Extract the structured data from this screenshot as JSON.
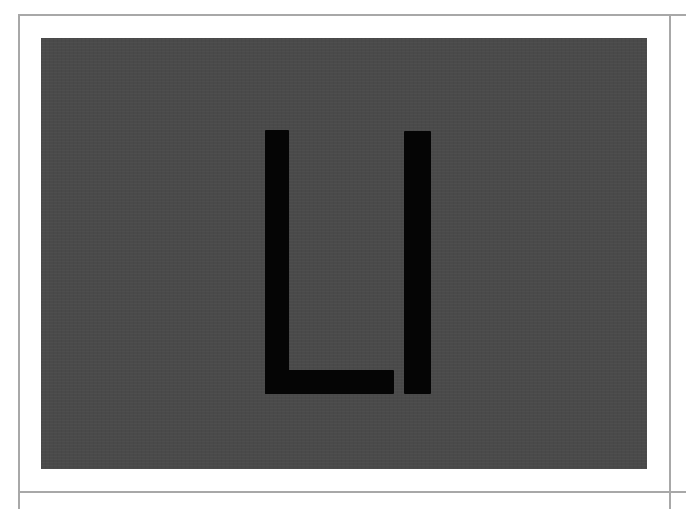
{
  "artwork": {
    "letters": [
      "L",
      "I"
    ],
    "text": "LI",
    "colors": {
      "background": "#ffffff",
      "frame_line": "#a8a8a8",
      "panel": "#4a4a4a",
      "glyph": "#050505"
    }
  }
}
